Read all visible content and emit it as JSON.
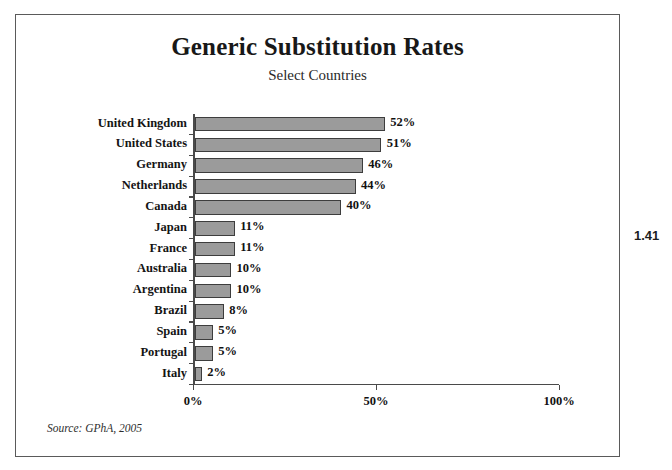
{
  "chart_data": {
    "type": "bar",
    "orientation": "horizontal",
    "title": "Generic Substitution Rates",
    "subtitle": "Select Countries",
    "xlabel": "",
    "ylabel": "",
    "xlim": [
      0,
      100
    ],
    "xticks": [
      "0%",
      "50%",
      "100%"
    ],
    "xtick_values": [
      0,
      50,
      100
    ],
    "grid": false,
    "legend": null,
    "categories": [
      "United Kingdom",
      "United States",
      "Germany",
      "Netherlands",
      "Canada",
      "Japan",
      "France",
      "Australia",
      "Argentina",
      "Brazil",
      "Spain",
      "Portugal",
      "Italy"
    ],
    "values": [
      52,
      51,
      46,
      44,
      40,
      11,
      11,
      10,
      10,
      8,
      5,
      5,
      2
    ],
    "value_labels": [
      "52%",
      "51%",
      "46%",
      "44%",
      "40%",
      "11%",
      "11%",
      "10%",
      "10%",
      "8%",
      "5%",
      "5%",
      "2%"
    ],
    "bar_color": "#9b9b9b",
    "bar_edge_color": "#3d3d3d",
    "axis_color": "#4a4a4a",
    "source": "Source: GPhA, 2005"
  },
  "annotations": {
    "margin_note": "1.41"
  }
}
